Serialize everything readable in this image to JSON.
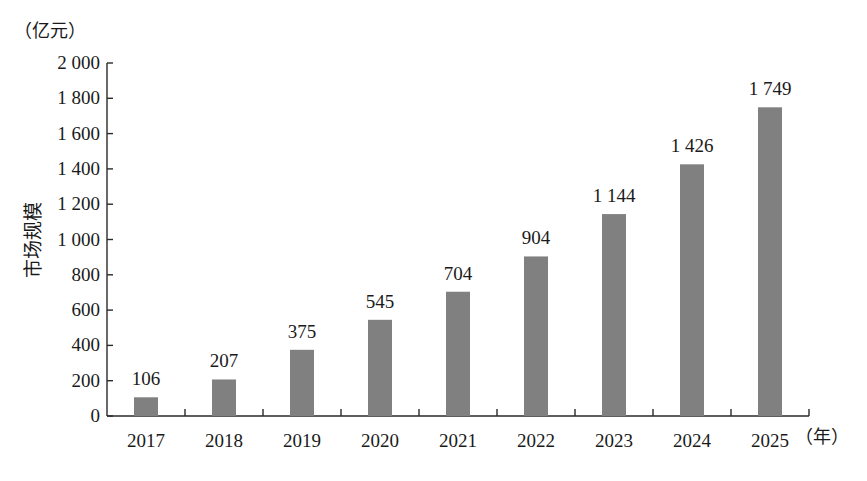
{
  "chart_data": {
    "type": "bar",
    "title": "",
    "xlabel": "（年）",
    "ylabel": "市场规模",
    "yunit": "（亿元）",
    "categories": [
      "2017",
      "2018",
      "2019",
      "2020",
      "2021",
      "2022",
      "2023",
      "2024",
      "2025"
    ],
    "values": [
      106,
      207,
      375,
      545,
      704,
      904,
      1144,
      1426,
      1749
    ],
    "value_labels": [
      "106",
      "207",
      "375",
      "545",
      "704",
      "904",
      "1 144",
      "1 426",
      "1 749"
    ],
    "ylim": [
      0,
      2000
    ],
    "yticks": [
      0,
      200,
      400,
      600,
      800,
      1000,
      1200,
      1400,
      1600,
      1800,
      2000
    ],
    "ytick_labels": [
      "0",
      "200",
      "400",
      "600",
      "800",
      "1 000",
      "1 200",
      "1 400",
      "1 600",
      "1 800",
      "2 000"
    ],
    "grid": false,
    "legend": null,
    "bar_color": "#808080"
  },
  "axis": {
    "y_unit_label": "（亿元）",
    "y_title": "市场规模",
    "x_unit_label": "（年）"
  }
}
